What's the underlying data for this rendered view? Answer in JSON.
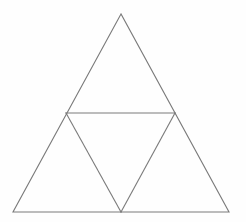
{
  "figure": {
    "canvas": {
      "width": 246,
      "height": 222
    },
    "background_color": "#fefefe",
    "stroke_color": "#7a7a7a",
    "stroke_width": 1.1,
    "fill": "none"
  },
  "geometry": {
    "points": {
      "apex": {
        "name": "apex",
        "x": 121,
        "y": 14
      },
      "bottom_left": {
        "name": "bottom-left",
        "x": 13,
        "y": 212
      },
      "bottom_right": {
        "name": "bottom-right",
        "x": 229,
        "y": 212
      },
      "mid_left": {
        "name": "left-leg-midpoint",
        "x": 66,
        "y": 113
      },
      "mid_right": {
        "name": "right-leg-midpoint",
        "x": 175,
        "y": 113
      },
      "mid_bottom": {
        "name": "base-midpoint",
        "x": 121,
        "y": 212
      }
    },
    "paths": {
      "outer_triangle": "M 121 14 L 13 212 L 229 212 Z",
      "midsegment_horizontal": "M 66 113 L 175 113",
      "inner_left_segment": "M 66 113 L 121 212",
      "inner_right_segment": "M 175 113 L 121 212"
    },
    "regions": [
      {
        "label": "top-triangle",
        "path": "M 121 14 L 66 113 L 175 113 Z"
      },
      {
        "label": "center-inverted-triangle",
        "path": "M 66 113 L 175 113 L 121 212 Z"
      },
      {
        "label": "bottom-left-triangle",
        "path": "M 66 113 L 13 212 L 121 212 Z"
      },
      {
        "label": "bottom-right-triangle",
        "path": "M 175 113 L 121 212 L 229 212 Z"
      }
    ]
  }
}
